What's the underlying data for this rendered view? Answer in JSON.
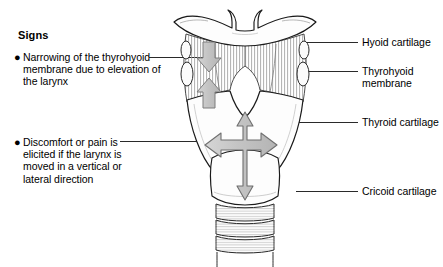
{
  "panel": {
    "heading": "Signs",
    "bullets": [
      {
        "marker": "●",
        "text": "Narrowing of the thyrohyoid membrane due to elevation of the larynx"
      },
      {
        "marker": "●",
        "text": "Discomfort or pain is elicited if the larynx is moved in a vertical or lateral direction"
      }
    ]
  },
  "labels": [
    {
      "id": "hyoid-cartilage",
      "text": "Hyoid cartilage"
    },
    {
      "id": "thyrohyoid-membrane",
      "text": "Thyrohyoid\nmembrane"
    },
    {
      "id": "thyroid-cartilage",
      "text": "Thyroid cartilage"
    },
    {
      "id": "cricoid-cartilage",
      "text": "Cricoid cartilage"
    }
  ],
  "figure": {
    "structures": [
      "hyoid-bone",
      "thyrohyoid-membrane",
      "thyroid-cartilage",
      "cricoid-cartilage",
      "tracheal-rings"
    ],
    "arrows": [
      {
        "id": "membrane-narrowing-down-arrow",
        "direction": "down"
      },
      {
        "id": "membrane-narrowing-up-arrow",
        "direction": "up"
      },
      {
        "id": "larynx-mobility-cross-arrow",
        "direction": "vertical-and-lateral"
      }
    ]
  },
  "colors": {
    "background": "#ffffff",
    "ink": "#000000",
    "leader_line": "#2a2a2a",
    "arrow_fill": "#c9c9c9",
    "arrow_stroke": "#8a8a8a",
    "hatch": "#9a9a9a",
    "cartilage_fill": "#fdfdfd",
    "shadow": "#d8d8d8"
  }
}
